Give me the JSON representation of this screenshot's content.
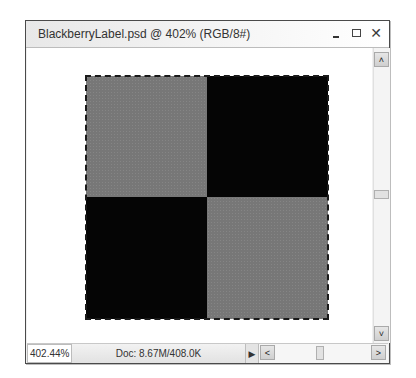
{
  "window": {
    "title": "BlackberryLabel.psd @ 402% (RGB/8#)",
    "controls": {
      "minimize": "minimize",
      "maximize": "maximize",
      "close": "✕"
    }
  },
  "canvas": {
    "checkerboard": [
      {
        "position": "top-left",
        "color": "#777777"
      },
      {
        "position": "top-right",
        "color": "#050505"
      },
      {
        "position": "bottom-left",
        "color": "#050505"
      },
      {
        "position": "bottom-right",
        "color": "#777777"
      }
    ],
    "selection": "marquee-around-checkerboard"
  },
  "scrollbars": {
    "vertical": {
      "up_glyph": "˄",
      "down_glyph": "˅"
    },
    "horizontal": {
      "left_glyph": "<",
      "right_glyph": ">"
    }
  },
  "statusbar": {
    "zoom": "402.44%",
    "doc_info": "Doc: 8.67M/408.0K",
    "menu_arrow": "▶"
  }
}
